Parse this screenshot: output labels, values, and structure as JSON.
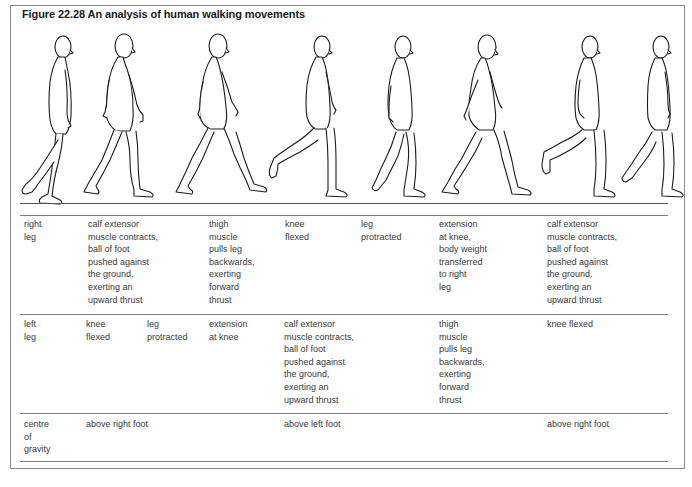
{
  "figure": {
    "title": "Figure 22.28  An analysis of human walking movements",
    "figure_count": 8,
    "illustration": "side-view line drawings of a man walking, eight successive phases of stride, standing on a ground line"
  },
  "table": {
    "rows": [
      {
        "label": "right\nleg",
        "cells": [
          {
            "col": 1,
            "text": "calf extensor\nmuscle contracts,\nball of foot\npushed against\nthe ground,\nexerting an\nupward thrust"
          },
          {
            "col": 3,
            "text": "thigh\nmuscle\npulls leg\nbackwards,\nexerting\nforward\nthrust"
          },
          {
            "col": 4,
            "text": "knee\nflexed"
          },
          {
            "col": 5,
            "text": "leg\nprotracted"
          },
          {
            "col": 6,
            "text": "extension\nat knee,\nbody weight\ntransferred\nto right\nleg"
          },
          {
            "col": 7,
            "text": "calf extensor\nmuscle contracts,\nball of foot\npushed against\nthe ground,\nexerting an\nupward thrust"
          }
        ]
      },
      {
        "label": "left\nleg",
        "cells": [
          {
            "col": 1,
            "text": "knee\nflexed"
          },
          {
            "col": 2,
            "text": "leg\nprotracted"
          },
          {
            "col": 3,
            "text": "extension\nat knee"
          },
          {
            "col": 4,
            "text": "calf extensor\nmuscle contracts,\nball of foot\npushed against\nthe ground,\nexerting an\nupward thrust"
          },
          {
            "col": 6,
            "text": "thigh\nmuscle\npulls leg\nbackwards,\nexerting\nforward\nthrust"
          },
          {
            "col": 7,
            "text": "knee flexed"
          }
        ]
      },
      {
        "label": "centre\nof\ngravity",
        "cells": [
          {
            "col": 1,
            "text": "above right foot"
          },
          {
            "col": 4,
            "text": "above left foot"
          },
          {
            "col": 7,
            "text": "above right foot"
          }
        ]
      }
    ]
  },
  "colors": {
    "ink": "#1a1a1a",
    "text": "#3a3a3a",
    "rule": "#7a7a7a",
    "background": "#ffffff"
  }
}
